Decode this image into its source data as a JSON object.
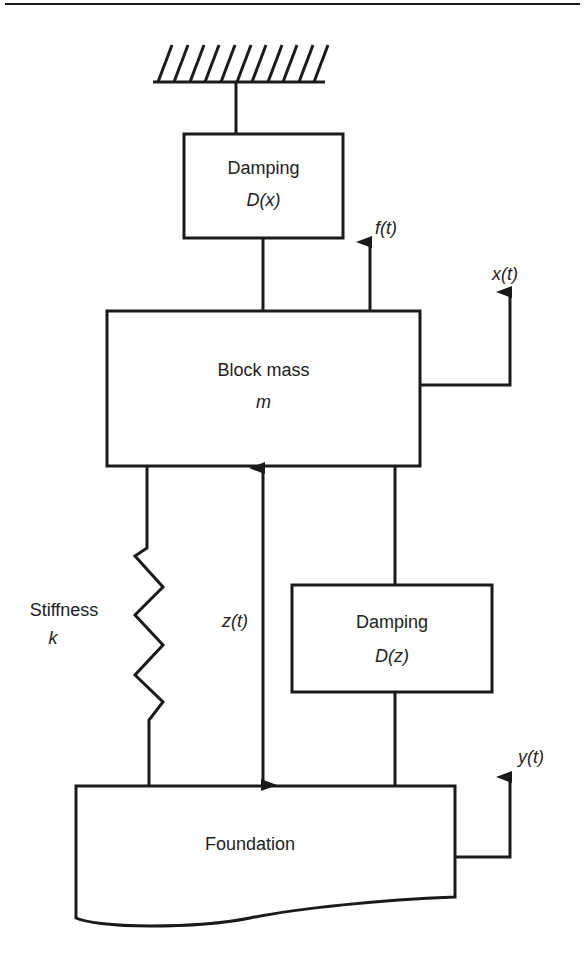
{
  "diagram": {
    "type": "mechanical vibration model (base-excited single-DOF system)",
    "colors": {
      "line": "#1a1a1a",
      "text": "#222222",
      "background": "#ffffff"
    },
    "ground": {
      "icon": "fixed-support-hatch"
    },
    "top_damper": {
      "title": "Damping",
      "symbol": "D(x)"
    },
    "mass": {
      "title": "Block mass",
      "symbol": "m"
    },
    "force": {
      "label": "f(t)"
    },
    "mass_displacement": {
      "label": "x(t)"
    },
    "spring": {
      "title": "Stiffness",
      "symbol": "k"
    },
    "relative_displacement": {
      "label": "z(t)"
    },
    "bottom_damper": {
      "title": "Damping",
      "symbol": "D(z)"
    },
    "foundation": {
      "title": "Foundation"
    },
    "foundation_displacement": {
      "label": "y(t)"
    }
  }
}
